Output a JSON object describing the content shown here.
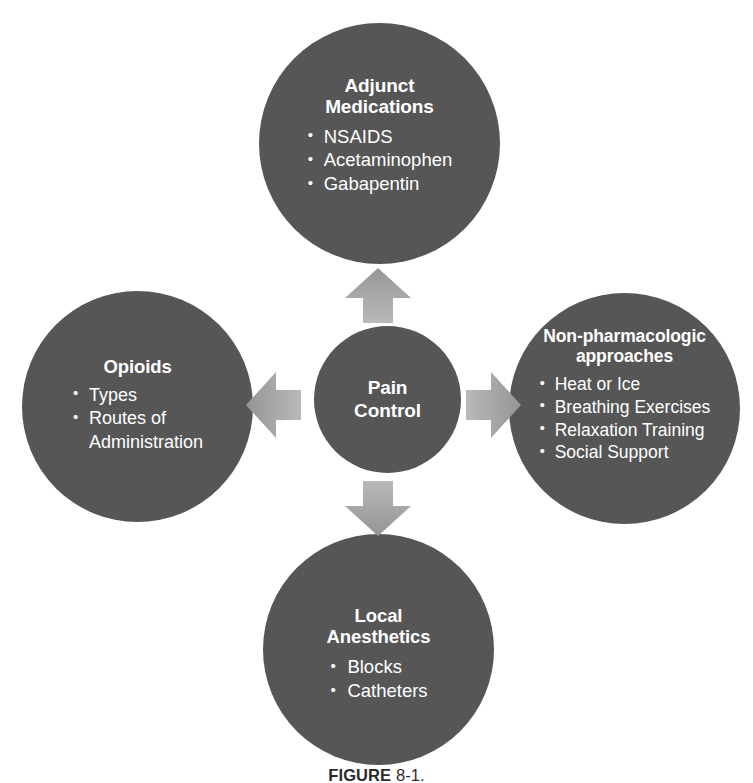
{
  "figure": {
    "caption_label": "FIGURE",
    "caption_rest": " 8-1.",
    "background_color": "#ffffff",
    "node_color": "#565656",
    "arrow_color": "#a8a8a8",
    "text_color": "#ffffff"
  },
  "center": {
    "title": "Pain\nControl"
  },
  "nodes": [
    {
      "id": "adjunct",
      "title": "Adjunct\nMedications",
      "items": [
        "NSAIDS",
        "Acetaminophen",
        "Gabapentin"
      ]
    },
    {
      "id": "opioids",
      "title": "Opioids",
      "items": [
        "Types",
        "Routes of\nAdministration"
      ]
    },
    {
      "id": "nonpharm",
      "title": "Non-pharmacologic\napproaches",
      "items": [
        "Heat or Ice",
        "Breathing Exercises",
        "Relaxation Training",
        "Social Support"
      ]
    },
    {
      "id": "local",
      "title": "Local\nAnesthetics",
      "items": [
        "Blocks",
        "Catheters"
      ]
    }
  ],
  "arrows": [
    {
      "id": "up",
      "direction": "up"
    },
    {
      "id": "right",
      "direction": "right"
    },
    {
      "id": "down",
      "direction": "down"
    },
    {
      "id": "left",
      "direction": "left"
    }
  ]
}
